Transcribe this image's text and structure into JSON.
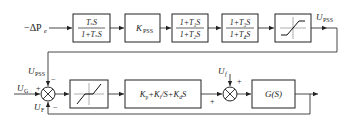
{
  "diagram": {
    "type": "block-diagram",
    "title": "",
    "pss_chain": {
      "input": {
        "label_prefix": "−ΔP",
        "label_sub": "e"
      },
      "blocks": [
        {
          "id": "washout",
          "numerator": "TₛS",
          "denominator": "1+TₛS"
        },
        {
          "id": "gain",
          "label": "K",
          "label_sub": "PSS"
        },
        {
          "id": "lead_lag_1",
          "numerator": "1+T₁S",
          "denominator": "1+T₂S"
        },
        {
          "id": "lead_lag_2",
          "numerator": "1+T₃S",
          "denominator": "1+T₄S"
        },
        {
          "id": "limiter",
          "symbol": "saturation"
        }
      ],
      "output": {
        "label": "U",
        "label_sub": "PSS"
      }
    },
    "control_loop": {
      "sum1": {
        "inputs": [
          {
            "label": "U",
            "label_sub": "PSS",
            "sign": "−",
            "position": "top"
          },
          {
            "label": "U",
            "label_sub": "G",
            "sign": "+",
            "position": "left"
          },
          {
            "label": "U",
            "label_sub": "F",
            "sign": "−",
            "position": "bottom"
          }
        ]
      },
      "blocks": [
        {
          "id": "dead_zone",
          "symbol": "dead-zone"
        },
        {
          "id": "pid",
          "label": "Kₚ+Kᵢ/S+K_dS",
          "parts": [
            "K",
            "p",
            "+K",
            "i",
            "/S+K",
            "d",
            "S"
          ]
        },
        {
          "id": "plant",
          "label": "G(S)"
        }
      ],
      "sum2": {
        "inputs": [
          {
            "label": "U",
            "label_sub": "f",
            "sign": "+",
            "position": "top"
          },
          {
            "sign": "+",
            "position": "left"
          }
        ]
      }
    }
  }
}
